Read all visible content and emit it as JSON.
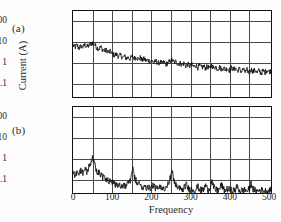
{
  "figure": {
    "xlabel": "Frequency",
    "ylabel": "Current (A)",
    "panel_a_label": "(a)",
    "panel_b_label": "(b)",
    "line_color": "#111111",
    "grid_color": "#4a4a4a",
    "background": "#fdfdfd"
  },
  "chart_data": [
    {
      "type": "line",
      "title": "(a)",
      "xlabel": "Frequency",
      "ylabel": "Current (A)",
      "xlim": [
        0,
        500
      ],
      "ylim": [
        0.03,
        300
      ],
      "yscale": "log",
      "grid": true,
      "legend": "none",
      "xticks": [
        0,
        100,
        200,
        300,
        400,
        500
      ],
      "yticks": [
        0.1,
        1,
        10,
        100
      ],
      "ytick_labels": [
        "0.1",
        "1",
        "10",
        "100"
      ],
      "x": [
        0,
        5,
        10,
        15,
        20,
        25,
        30,
        35,
        40,
        45,
        50,
        55,
        60,
        65,
        70,
        75,
        80,
        85,
        90,
        95,
        100,
        105,
        110,
        115,
        120,
        125,
        130,
        135,
        140,
        145,
        150,
        155,
        160,
        165,
        170,
        175,
        180,
        185,
        190,
        195,
        200,
        205,
        210,
        215,
        220,
        225,
        230,
        235,
        240,
        245,
        250,
        255,
        260,
        265,
        270,
        275,
        280,
        285,
        290,
        295,
        300,
        305,
        310,
        315,
        320,
        325,
        330,
        335,
        340,
        345,
        350,
        355,
        360,
        365,
        370,
        375,
        380,
        385,
        390,
        395,
        400,
        405,
        410,
        415,
        420,
        425,
        430,
        435,
        440,
        445,
        450,
        455,
        460,
        465,
        470,
        475,
        480,
        485,
        490,
        495,
        500
      ],
      "values": [
        7.5,
        6.0,
        7.8,
        5.5,
        7.0,
        6.2,
        8.0,
        6.5,
        7.2,
        8.8,
        10.0,
        8.2,
        6.0,
        5.2,
        6.4,
        4.8,
        4.2,
        4.6,
        3.6,
        3.9,
        3.0,
        2.6,
        2.9,
        2.3,
        2.6,
        2.1,
        2.3,
        1.9,
        2.1,
        1.8,
        2.4,
        1.9,
        2.2,
        1.7,
        2.0,
        1.5,
        1.8,
        1.4,
        1.6,
        1.3,
        1.5,
        1.2,
        1.4,
        1.1,
        1.3,
        1.05,
        1.25,
        1.0,
        1.2,
        1.3,
        1.6,
        1.2,
        1.35,
        1.0,
        1.15,
        0.95,
        1.1,
        0.85,
        1.0,
        0.8,
        0.95,
        0.75,
        0.9,
        0.7,
        0.85,
        0.68,
        0.82,
        0.65,
        0.8,
        0.62,
        0.9,
        0.66,
        0.78,
        0.6,
        0.74,
        0.58,
        0.7,
        0.55,
        0.68,
        0.52,
        0.72,
        0.55,
        0.66,
        0.5,
        0.62,
        0.46,
        0.58,
        0.42,
        0.55,
        0.38,
        0.6,
        0.44,
        0.56,
        0.4,
        0.52,
        0.38,
        0.5,
        0.42,
        0.55,
        0.45,
        0.5
      ]
    },
    {
      "type": "line",
      "title": "(b)",
      "xlabel": "Frequency",
      "ylabel": "Current (A)",
      "xlim": [
        0,
        500
      ],
      "ylim": [
        0.03,
        300
      ],
      "yscale": "log",
      "grid": true,
      "legend": "none",
      "xticks": [
        0,
        100,
        200,
        300,
        400,
        500
      ],
      "yticks": [
        0.1,
        1,
        10,
        100
      ],
      "ytick_labels": [
        "0.1",
        "1",
        "10",
        "100"
      ],
      "x": [
        0,
        5,
        10,
        15,
        20,
        25,
        30,
        35,
        40,
        45,
        50,
        55,
        60,
        65,
        70,
        75,
        80,
        85,
        90,
        95,
        100,
        105,
        110,
        115,
        120,
        125,
        130,
        135,
        140,
        145,
        150,
        155,
        160,
        165,
        170,
        175,
        180,
        185,
        190,
        195,
        200,
        205,
        210,
        215,
        220,
        225,
        230,
        235,
        240,
        245,
        250,
        255,
        260,
        265,
        270,
        275,
        280,
        285,
        290,
        295,
        300,
        305,
        310,
        315,
        320,
        325,
        330,
        335,
        340,
        345,
        350,
        355,
        360,
        365,
        370,
        375,
        380,
        385,
        390,
        395,
        400,
        405,
        410,
        415,
        420,
        425,
        430,
        435,
        440,
        445,
        450,
        455,
        460,
        465,
        470,
        475,
        480,
        485,
        490,
        495,
        500
      ],
      "values": [
        0.28,
        0.2,
        0.3,
        0.22,
        0.35,
        0.26,
        0.42,
        0.3,
        0.5,
        0.7,
        1.3,
        0.62,
        0.34,
        0.26,
        0.22,
        0.17,
        0.15,
        0.12,
        0.11,
        0.095,
        0.085,
        0.075,
        0.08,
        0.068,
        0.072,
        0.062,
        0.07,
        0.06,
        0.09,
        0.12,
        0.42,
        0.16,
        0.1,
        0.075,
        0.068,
        0.06,
        0.058,
        0.055,
        0.06,
        0.052,
        0.07,
        0.055,
        0.05,
        0.048,
        0.052,
        0.046,
        0.05,
        0.06,
        0.09,
        0.14,
        0.3,
        0.12,
        0.07,
        0.05,
        0.046,
        0.044,
        0.048,
        0.08,
        0.052,
        0.044,
        0.046,
        0.042,
        0.044,
        0.06,
        0.042,
        0.04,
        0.044,
        0.07,
        0.042,
        0.048,
        0.11,
        0.055,
        0.042,
        0.04,
        0.044,
        0.075,
        0.042,
        0.04,
        0.046,
        0.042,
        0.04,
        0.038,
        0.042,
        0.06,
        0.04,
        0.038,
        0.042,
        0.04,
        0.038,
        0.044,
        0.09,
        0.045,
        0.038,
        0.036,
        0.04,
        0.038,
        0.042,
        0.036,
        0.04,
        0.038,
        0.042
      ]
    }
  ],
  "axes": {
    "xticks": [
      "0",
      "100",
      "200",
      "300",
      "400",
      "500"
    ],
    "yticks_a": [
      "100",
      "10",
      "1",
      "0.1"
    ],
    "yticks_b": [
      "100",
      "10",
      "1",
      "0.1"
    ]
  }
}
